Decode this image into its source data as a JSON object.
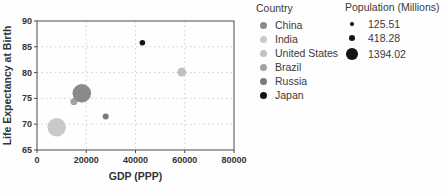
{
  "chart_data": {
    "type": "scatter",
    "title": "",
    "xlabel": "GDP (PPP)",
    "ylabel": "Life Expectancy at Birth",
    "xlim": [
      0,
      80000
    ],
    "ylim": [
      65,
      90
    ],
    "xticks": [
      0,
      20000,
      40000,
      60000,
      80000
    ],
    "yticks": [
      65,
      70,
      75,
      80,
      85,
      90
    ],
    "grid": true,
    "legend_position": "right",
    "points": [
      {
        "country": "India",
        "gdp_ppp": 8000,
        "life_expectancy": 69.4,
        "population_millions": 1366,
        "color": "#c9c9c9"
      },
      {
        "country": "Brazil",
        "gdp_ppp": 15000,
        "life_expectancy": 74.4,
        "population_millions": 211,
        "color": "#a3a3a3"
      },
      {
        "country": "China",
        "gdp_ppp": 18200,
        "life_expectancy": 76.0,
        "population_millions": 1394.02,
        "color": "#8a8a8a"
      },
      {
        "country": "Russia",
        "gdp_ppp": 27900,
        "life_expectancy": 71.5,
        "population_millions": 146,
        "color": "#7a7a7a"
      },
      {
        "country": "Japan",
        "gdp_ppp": 42800,
        "life_expectancy": 85.8,
        "population_millions": 125.51,
        "color": "#141414"
      },
      {
        "country": "United States",
        "gdp_ppp": 58800,
        "life_expectancy": 80.1,
        "population_millions": 328,
        "color": "#c0c0c0"
      }
    ],
    "color_legend_title": "Country",
    "color_legend": [
      {
        "label": "China",
        "color": "#8a8a8a"
      },
      {
        "label": "India",
        "color": "#c9c9c9"
      },
      {
        "label": "United States",
        "color": "#c0c0c0"
      },
      {
        "label": "Brazil",
        "color": "#a3a3a3"
      },
      {
        "label": "Russia",
        "color": "#7a7a7a"
      },
      {
        "label": "Japan",
        "color": "#141414"
      }
    ],
    "size_legend_title": "Population (Millions)",
    "size_legend": [
      {
        "label": "125.51",
        "value": 125.51
      },
      {
        "label": "418.28",
        "value": 418.28
      },
      {
        "label": "1394.02",
        "value": 1394.02
      }
    ],
    "colors": {
      "text": "#333333",
      "spine": "#4a4a4a",
      "grid": "#cfcfcf",
      "legend_dot_default": "#141414"
    }
  }
}
